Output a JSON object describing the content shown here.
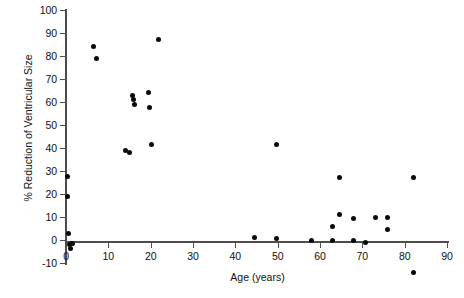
{
  "chart_data": {
    "type": "scatter",
    "title": "",
    "xlabel": "Age (years)",
    "ylabel": "% Reduction of Ventricular Size",
    "xlim": [
      0,
      90
    ],
    "ylim": [
      -10,
      100
    ],
    "xticks": [
      0,
      10,
      20,
      30,
      40,
      50,
      60,
      70,
      80,
      90
    ],
    "yticks": [
      -10,
      0,
      10,
      20,
      30,
      40,
      50,
      60,
      70,
      80,
      90,
      100
    ],
    "grid": false,
    "legend": null,
    "series": [
      {
        "name": "patients",
        "marker": "filled-circle",
        "color": "#0a0a0a",
        "points": [
          {
            "x": 0.4,
            "y": 27.5
          },
          {
            "x": 0.4,
            "y": 19
          },
          {
            "x": 0.5,
            "y": 3
          },
          {
            "x": 0.8,
            "y": -2
          },
          {
            "x": 1.1,
            "y": -3.5
          },
          {
            "x": 1.3,
            "y": -1.5
          },
          {
            "x": 1.6,
            "y": -1.5
          },
          {
            "x": 6.5,
            "y": 84
          },
          {
            "x": 7.2,
            "y": 79
          },
          {
            "x": 14.0,
            "y": 39
          },
          {
            "x": 15.0,
            "y": 38
          },
          {
            "x": 15.6,
            "y": 63
          },
          {
            "x": 15.9,
            "y": 61
          },
          {
            "x": 16.2,
            "y": 59
          },
          {
            "x": 19.5,
            "y": 64
          },
          {
            "x": 19.8,
            "y": 57.5
          },
          {
            "x": 20.3,
            "y": 41.5
          },
          {
            "x": 21.8,
            "y": 87
          },
          {
            "x": 44.5,
            "y": 1
          },
          {
            "x": 49.8,
            "y": 41.5
          },
          {
            "x": 49.8,
            "y": 0.5
          },
          {
            "x": 58.0,
            "y": 0
          },
          {
            "x": 63.0,
            "y": 6
          },
          {
            "x": 63.0,
            "y": 0
          },
          {
            "x": 64.6,
            "y": 27
          },
          {
            "x": 64.6,
            "y": 11
          },
          {
            "x": 67.8,
            "y": 9.5
          },
          {
            "x": 67.8,
            "y": 0
          },
          {
            "x": 70.7,
            "y": -1
          },
          {
            "x": 73.2,
            "y": 10
          },
          {
            "x": 76.0,
            "y": 10
          },
          {
            "x": 76.0,
            "y": 4.5
          },
          {
            "x": 82.2,
            "y": 27
          },
          {
            "x": 82.2,
            "y": -14
          }
        ]
      }
    ]
  },
  "axes": {
    "x": {
      "title": "Age (years)",
      "tick_labels": [
        "0",
        "10",
        "20",
        "30",
        "40",
        "50",
        "60",
        "70",
        "80",
        "90"
      ]
    },
    "y": {
      "title": "% Reduction of Ventricular Size",
      "tick_labels": [
        "100",
        "90",
        "80",
        "70",
        "60",
        "50",
        "40",
        "30",
        "20",
        "10",
        "0",
        "-10"
      ]
    }
  }
}
